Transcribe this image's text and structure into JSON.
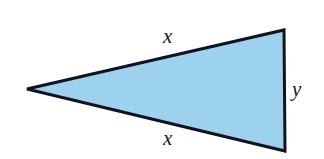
{
  "figure": {
    "name": "isosceles-triangle",
    "background_color": "#ffffff",
    "shape": {
      "type": "triangle",
      "fill_color": "#9DD2EE",
      "stroke_color": "#11131f",
      "stroke_width": 3,
      "vertices": [
        {
          "name": "left-apex",
          "x": 27,
          "y": 89
        },
        {
          "name": "top-right",
          "x": 284,
          "y": 30
        },
        {
          "name": "bottom-right",
          "x": 285,
          "y": 151
        }
      ]
    },
    "labels": {
      "top_side": "x",
      "bottom_side": "x",
      "right_side": "y"
    }
  }
}
